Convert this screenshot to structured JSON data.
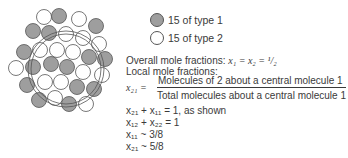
{
  "legend": {
    "type1": {
      "label": "15 of type 1",
      "color": "#9e9e9e"
    },
    "type2": {
      "label": "15 of type 2",
      "color": "#ffffff"
    }
  },
  "text": {
    "overall_label": "Overall mole fractions:",
    "overall_eq": "x₁ = x₂ = ¹/₂",
    "local_label": "Local mole fractions:",
    "x21_lhs": "x₂₁ =",
    "numerator": "Molecules of 2 about a central molecule 1",
    "denominator": "Total molecules about a central molecule 1",
    "eq1": "x₂₁ + x₁₁ = 1, as shown",
    "eq2": "x₁₂ + x₂₂ = 1",
    "eq3": "x₁₁ ~ 3/8",
    "eq4": "x₂₁ ~ 5/8"
  },
  "molecules": [
    {
      "cx": 44,
      "cy": 17,
      "t": 2
    },
    {
      "cx": 59,
      "cy": 16,
      "t": 1
    },
    {
      "cx": 79,
      "cy": 19,
      "t": 2
    },
    {
      "cx": 96,
      "cy": 26,
      "t": 1
    },
    {
      "cx": 33,
      "cy": 31,
      "t": 1
    },
    {
      "cx": 49,
      "cy": 33,
      "t": 1
    },
    {
      "cx": 66,
      "cy": 34,
      "t": 2
    },
    {
      "cx": 83,
      "cy": 38,
      "t": 2
    },
    {
      "cx": 99,
      "cy": 44,
      "t": 2
    },
    {
      "cx": 24,
      "cy": 52,
      "t": 1
    },
    {
      "cx": 40,
      "cy": 50,
      "t": 2
    },
    {
      "cx": 57,
      "cy": 50,
      "t": 2
    },
    {
      "cx": 73,
      "cy": 52,
      "t": 2
    },
    {
      "cx": 89,
      "cy": 57,
      "t": 1
    },
    {
      "cx": 105,
      "cy": 59,
      "t": 1
    },
    {
      "cx": 16,
      "cy": 68,
      "t": 2
    },
    {
      "cx": 33,
      "cy": 67,
      "t": 1
    },
    {
      "cx": 51,
      "cy": 64,
      "t": 1
    },
    {
      "cx": 67,
      "cy": 67,
      "t": 1
    },
    {
      "cx": 83,
      "cy": 72,
      "t": 2
    },
    {
      "cx": 102,
      "cy": 75,
      "t": 2
    },
    {
      "cx": 27,
      "cy": 85,
      "t": 1
    },
    {
      "cx": 45,
      "cy": 82,
      "t": 2
    },
    {
      "cx": 61,
      "cy": 82,
      "t": 2
    },
    {
      "cx": 77,
      "cy": 87,
      "t": 1
    },
    {
      "cx": 94,
      "cy": 89,
      "t": 1
    },
    {
      "cx": 39,
      "cy": 100,
      "t": 1
    },
    {
      "cx": 55,
      "cy": 98,
      "t": 2
    },
    {
      "cx": 69,
      "cy": 104,
      "t": 1
    },
    {
      "cx": 86,
      "cy": 104,
      "t": 2
    }
  ],
  "boundary": {
    "cx": 66,
    "cy": 69,
    "r1": 35,
    "r2": 38
  }
}
